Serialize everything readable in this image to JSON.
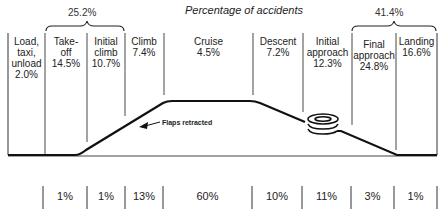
{
  "title": "Percentage of accidents",
  "groups": [
    {
      "label": "25.2%",
      "span": [
        "Take-off",
        "Initial climb"
      ]
    },
    {
      "label": "41.4%",
      "span": [
        "Final approach",
        "Landing"
      ]
    }
  ],
  "phases": [
    {
      "name": "Load, taxi, unload",
      "lines": [
        "Load,",
        "taxi,",
        "unload"
      ],
      "accident_pct": "2.0%"
    },
    {
      "name": "Take-off",
      "lines": [
        "Take-",
        "off"
      ],
      "accident_pct": "14.5%"
    },
    {
      "name": "Initial climb",
      "lines": [
        "Initial",
        "climb"
      ],
      "accident_pct": "10.7%"
    },
    {
      "name": "Climb",
      "lines": [
        "Climb"
      ],
      "accident_pct": "7.4%"
    },
    {
      "name": "Cruise",
      "lines": [
        "Cruise"
      ],
      "accident_pct": "4.5%"
    },
    {
      "name": "Descent",
      "lines": [
        "Descent"
      ],
      "accident_pct": "7.2%"
    },
    {
      "name": "Initial approach",
      "lines": [
        "Initial",
        "approach"
      ],
      "accident_pct": "12.3%"
    },
    {
      "name": "Final approach",
      "lines": [
        "Final",
        "approach"
      ],
      "accident_pct": "24.8%"
    },
    {
      "name": "Landing",
      "lines": [
        "Landing"
      ],
      "accident_pct": "16.6%"
    }
  ],
  "annotation": "Flaps retracted",
  "flight_time_pct": [
    "1%",
    "1%",
    "13%",
    "60%",
    "10%",
    "11%",
    "3%",
    "1%"
  ],
  "colors": {
    "line": "#1a1a1a",
    "thin": "#444444"
  }
}
